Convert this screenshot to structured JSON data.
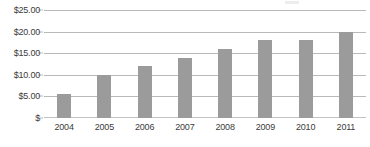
{
  "chart_data": {
    "type": "bar",
    "title": "",
    "subtitle": "",
    "xlabel": "",
    "ylabel": "",
    "categories": [
      "2004",
      "2005",
      "2006",
      "2007",
      "2008",
      "2009",
      "2010",
      "2011"
    ],
    "values": [
      5.5,
      10.0,
      12.0,
      14.0,
      16.0,
      18.0,
      18.0,
      20.0
    ],
    "series": [
      {
        "name": "",
        "values": [
          5.5,
          10.0,
          12.0,
          14.0,
          16.0,
          18.0,
          18.0,
          20.0
        ]
      }
    ],
    "ylim": [
      0,
      25
    ],
    "ytick_values": [
      0,
      5,
      10,
      15,
      20,
      25
    ],
    "ytick_labels": [
      "$",
      "$5.00",
      "$10.00",
      "$15.00",
      "$20.00",
      "$25.00"
    ],
    "grid": true,
    "legend": false,
    "legend_position": "none",
    "bar_color": "#9b9b9b",
    "gridline_color": "#b9b9b9",
    "axis_text_color": "#3b3b3b",
    "background_color": "#ffffff"
  }
}
